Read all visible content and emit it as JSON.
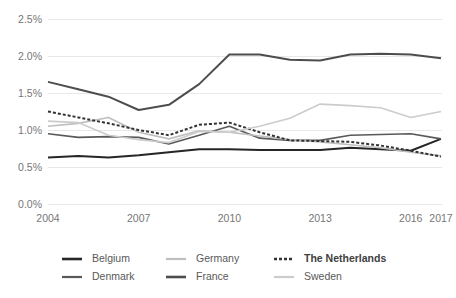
{
  "chart_data": {
    "type": "line",
    "title": "",
    "xlabel": "",
    "ylabel": "",
    "x": [
      2004,
      2005,
      2006,
      2007,
      2008,
      2009,
      2010,
      2011,
      2012,
      2013,
      2014,
      2015,
      2016,
      2017
    ],
    "xtick_labels": [
      "2004",
      "2007",
      "2010",
      "2013",
      "2016",
      "2017"
    ],
    "xtick_values": [
      2004,
      2007,
      2010,
      2013,
      2016,
      2017
    ],
    "ytick_labels": [
      "0.0%",
      "0.5%",
      "1.0%",
      "1.5%",
      "2.0%",
      "2.5%"
    ],
    "ytick_values": [
      0.0,
      0.5,
      1.0,
      1.5,
      2.0,
      2.5
    ],
    "ylim": [
      0.0,
      2.5
    ],
    "xlim": [
      2004,
      2017
    ],
    "grid": "horizontal",
    "legend_position": "bottom",
    "series": [
      {
        "name": "Belgium",
        "color": "#262626",
        "width": 2.0,
        "dash": "none",
        "values": [
          0.63,
          0.65,
          0.63,
          0.66,
          0.7,
          0.74,
          0.74,
          0.73,
          0.73,
          0.73,
          0.76,
          0.74,
          0.72,
          0.88
        ]
      },
      {
        "name": "Denmark",
        "color": "#595959",
        "width": 1.6,
        "dash": "none",
        "values": [
          0.95,
          0.9,
          0.91,
          0.9,
          0.81,
          0.93,
          1.05,
          0.89,
          0.86,
          0.86,
          0.93,
          0.94,
          0.95,
          0.88
        ]
      },
      {
        "name": "Germany",
        "color": "#bfbfbf",
        "width": 1.6,
        "dash": "none",
        "values": [
          1.05,
          1.09,
          1.17,
          0.97,
          0.88,
          0.99,
          0.97,
          0.92,
          0.87,
          0.84,
          0.8,
          0.76,
          0.7,
          0.65
        ]
      },
      {
        "name": "France",
        "color": "#4d4d4d",
        "width": 2.0,
        "dash": "none",
        "values": [
          1.65,
          1.55,
          1.45,
          1.27,
          1.34,
          1.62,
          2.02,
          2.02,
          1.95,
          1.94,
          2.02,
          2.03,
          2.02,
          1.97
        ]
      },
      {
        "name": "The Netherlands",
        "color": "#333333",
        "width": 2.0,
        "dash": "3,2",
        "values": [
          1.25,
          1.17,
          1.09,
          1.0,
          0.93,
          1.07,
          1.1,
          0.97,
          0.86,
          0.85,
          0.84,
          0.79,
          0.72,
          0.64
        ]
      },
      {
        "name": "Sweden",
        "color": "#cccccc",
        "width": 1.6,
        "dash": "none",
        "values": [
          1.12,
          1.1,
          0.93,
          0.87,
          0.83,
          0.98,
          0.97,
          1.05,
          1.16,
          1.35,
          1.33,
          1.3,
          1.17,
          1.25
        ]
      }
    ],
    "legend": [
      {
        "label": "Belgium",
        "color": "#262626",
        "width": 2.0,
        "dash": "none",
        "bold": false
      },
      {
        "label": "Germany",
        "color": "#bfbfbf",
        "width": 1.6,
        "dash": "none",
        "bold": false
      },
      {
        "label": "The Netherlands",
        "color": "#333333",
        "width": 2.0,
        "dash": "3,2",
        "bold": true
      },
      {
        "label": "Denmark",
        "color": "#595959",
        "width": 1.6,
        "dash": "none",
        "bold": false
      },
      {
        "label": "France",
        "color": "#4d4d4d",
        "width": 2.0,
        "dash": "none",
        "bold": false
      },
      {
        "label": "Sweden",
        "color": "#cccccc",
        "width": 1.6,
        "dash": "none",
        "bold": false
      }
    ]
  }
}
